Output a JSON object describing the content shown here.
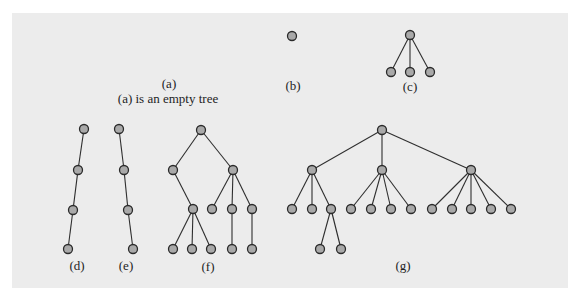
{
  "figure": {
    "node_color": "#a9a9a9",
    "edge_color": "#2e2e2e",
    "panel_color": "#ececec"
  },
  "labels": {
    "a": "(a)",
    "a_caption": "(a) is an empty tree",
    "b": "(b)",
    "c": "(c)",
    "d": "(d)",
    "e": "(e)",
    "f": "(f)",
    "g": "(g)"
  },
  "trees": [
    {
      "id": "a",
      "label": "(a)",
      "nodes": [],
      "edges": []
    },
    {
      "id": "b",
      "label": "(b)",
      "nodes": [
        [
          292,
          36
        ]
      ],
      "edges": []
    },
    {
      "id": "c",
      "label": "(c)",
      "nodes": [
        [
          410,
          35
        ],
        [
          391,
          72
        ],
        [
          410,
          72
        ],
        [
          430,
          72
        ]
      ],
      "edges": [
        [
          0,
          1
        ],
        [
          0,
          2
        ],
        [
          0,
          3
        ]
      ]
    },
    {
      "id": "d",
      "label": "(d)",
      "nodes": [
        [
          84,
          129
        ],
        [
          78,
          170
        ],
        [
          73,
          210
        ],
        [
          68,
          249
        ]
      ],
      "edges": [
        [
          0,
          1
        ],
        [
          1,
          2
        ],
        [
          2,
          3
        ]
      ]
    },
    {
      "id": "e",
      "label": "(e)",
      "nodes": [
        [
          119,
          129
        ],
        [
          124,
          170
        ],
        [
          128,
          210
        ],
        [
          133,
          249
        ]
      ],
      "edges": [
        [
          0,
          1
        ],
        [
          1,
          2
        ],
        [
          2,
          3
        ]
      ]
    },
    {
      "id": "f",
      "label": "(f)",
      "nodes": [
        [
          201,
          130
        ],
        [
          173,
          170
        ],
        [
          233,
          170
        ],
        [
          193,
          209
        ],
        [
          212,
          209
        ],
        [
          232,
          209
        ],
        [
          252,
          209
        ],
        [
          173,
          249
        ],
        [
          192,
          249
        ],
        [
          211,
          249
        ],
        [
          232,
          249
        ],
        [
          252,
          249
        ]
      ],
      "edges": [
        [
          0,
          1
        ],
        [
          0,
          2
        ],
        [
          1,
          3
        ],
        [
          2,
          4
        ],
        [
          2,
          5
        ],
        [
          2,
          6
        ],
        [
          3,
          7
        ],
        [
          3,
          8
        ],
        [
          3,
          9
        ],
        [
          5,
          10
        ],
        [
          6,
          11
        ]
      ]
    },
    {
      "id": "g",
      "label": "(g)",
      "nodes": [
        [
          382,
          130
        ],
        [
          312,
          170
        ],
        [
          382,
          170
        ],
        [
          471,
          170
        ],
        [
          292,
          209
        ],
        [
          312,
          209
        ],
        [
          331,
          209
        ],
        [
          351,
          209
        ],
        [
          371,
          209
        ],
        [
          391,
          209
        ],
        [
          411,
          209
        ],
        [
          432,
          209
        ],
        [
          452,
          209
        ],
        [
          471,
          209
        ],
        [
          491,
          209
        ],
        [
          511,
          209
        ],
        [
          320,
          249
        ],
        [
          341,
          249
        ]
      ],
      "edges": [
        [
          0,
          1
        ],
        [
          0,
          2
        ],
        [
          0,
          3
        ],
        [
          1,
          4
        ],
        [
          1,
          5
        ],
        [
          1,
          6
        ],
        [
          2,
          7
        ],
        [
          2,
          8
        ],
        [
          2,
          9
        ],
        [
          2,
          10
        ],
        [
          3,
          11
        ],
        [
          3,
          12
        ],
        [
          3,
          13
        ],
        [
          3,
          14
        ],
        [
          3,
          15
        ],
        [
          6,
          16
        ],
        [
          6,
          17
        ]
      ]
    }
  ]
}
